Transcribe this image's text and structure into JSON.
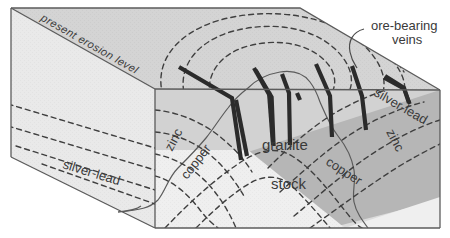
{
  "figure": {
    "type": "geologic-block-diagram",
    "width": 450,
    "height": 238
  },
  "labels": {
    "erosion_level": "present erosion level",
    "ore_veins_line1": "ore-bearing",
    "ore_veins_line2": "veins",
    "granite": "granite",
    "stock": "stock",
    "silver_lead_left": "silver-lead",
    "silver_lead_right": "silver-lead",
    "zinc_left": "zinc",
    "zinc_right": "zinc",
    "copper_left": "copper",
    "copper_right": "copper"
  },
  "zones": [
    {
      "name": "silver-lead",
      "order": 4,
      "note": "outermost mineral zone"
    },
    {
      "name": "zinc",
      "order": 3,
      "note": "outer mineral zone"
    },
    {
      "name": "copper",
      "order": 2,
      "note": "inner mineral zone"
    },
    {
      "name": "granite stock",
      "order": 1,
      "note": "intrusive core"
    }
  ],
  "colors": {
    "left_face": "#e9e9e9",
    "top_face": "#d4d4d4",
    "front_face_light": "#dcdcdc",
    "front_face_dark": "#b6b6b6",
    "stock_fill": "#f1f1f1",
    "outline": "#5b5b5b",
    "dashed_zone_line": "#4a4a4a",
    "vein": "#2b2b2b",
    "text": "#3a3a3a",
    "leader": "#4a4a4a"
  },
  "counts": {
    "veins": 9,
    "zone_boundaries": 6
  }
}
